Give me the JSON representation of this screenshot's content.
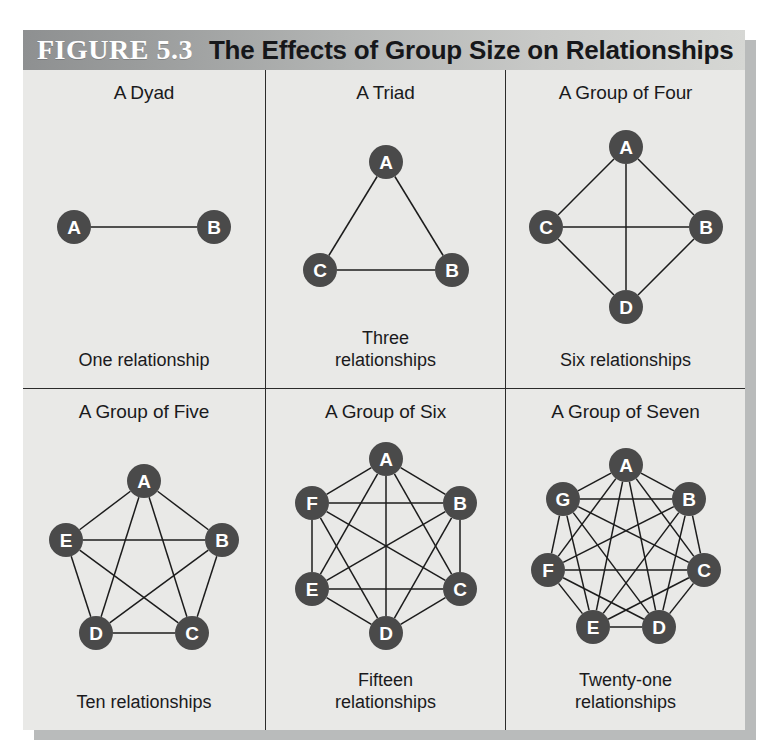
{
  "figure": {
    "label": "FIGURE 5.3",
    "title": "The Effects of Group Size on Relationships",
    "header_bg_left": "#8e9091",
    "header_bg_right": "#d6d7d4",
    "card_bg": "#e9e9e7",
    "node_color": "#4a4a4a",
    "node_text_color": "#ffffff",
    "edge_color": "#1c1c1c"
  },
  "panels": [
    {
      "title": "A Dyad",
      "caption": "One relationship",
      "members": 2,
      "relationships": 1,
      "layout": "linear",
      "nodes": [
        {
          "id": "A",
          "x": 46,
          "y": 72
        },
        {
          "id": "B",
          "x": 186,
          "y": 72
        }
      ],
      "edges": [
        [
          "A",
          "B"
        ]
      ]
    },
    {
      "title": "A Triad",
      "caption": "Three\nrelationships",
      "members": 3,
      "relationships": 3,
      "layout": "polygon",
      "nodes": [
        {
          "id": "A",
          "x": 110,
          "y": 22
        },
        {
          "id": "B",
          "x": 176,
          "y": 130
        },
        {
          "id": "C",
          "x": 44,
          "y": 130
        }
      ],
      "edges": [
        [
          "A",
          "B"
        ],
        [
          "B",
          "C"
        ],
        [
          "C",
          "A"
        ]
      ]
    },
    {
      "title": "A Group of Four",
      "caption": "Six relationships",
      "members": 4,
      "relationships": 6,
      "layout": "diamond",
      "nodes": [
        {
          "id": "A",
          "x": 105,
          "y": 20
        },
        {
          "id": "B",
          "x": 185,
          "y": 100
        },
        {
          "id": "D",
          "x": 105,
          "y": 180
        },
        {
          "id": "C",
          "x": 25,
          "y": 100
        }
      ],
      "edges": [
        [
          "A",
          "B"
        ],
        [
          "A",
          "C"
        ],
        [
          "A",
          "D"
        ],
        [
          "B",
          "C"
        ],
        [
          "B",
          "D"
        ],
        [
          "C",
          "D"
        ]
      ]
    },
    {
      "title": "A Group of Five",
      "caption": "Ten relationships",
      "members": 5,
      "relationships": 10,
      "layout": "pentagon",
      "nodes": [
        {
          "id": "A",
          "x": 104,
          "y": 20
        },
        {
          "id": "B",
          "x": 182,
          "y": 79
        },
        {
          "id": "C",
          "x": 152,
          "y": 172
        },
        {
          "id": "D",
          "x": 56,
          "y": 172
        },
        {
          "id": "E",
          "x": 26,
          "y": 79
        }
      ],
      "edges": [
        [
          "A",
          "B"
        ],
        [
          "A",
          "C"
        ],
        [
          "A",
          "D"
        ],
        [
          "A",
          "E"
        ],
        [
          "B",
          "C"
        ],
        [
          "B",
          "D"
        ],
        [
          "B",
          "E"
        ],
        [
          "C",
          "D"
        ],
        [
          "C",
          "E"
        ],
        [
          "D",
          "E"
        ]
      ]
    },
    {
      "title": "A Group of Six",
      "caption": "Fifteen\nrelationships",
      "members": 6,
      "relationships": 15,
      "layout": "hexagon",
      "nodes": [
        {
          "id": "A",
          "x": 103,
          "y": 18
        },
        {
          "id": "B",
          "x": 177,
          "y": 62
        },
        {
          "id": "C",
          "x": 177,
          "y": 148
        },
        {
          "id": "D",
          "x": 103,
          "y": 192
        },
        {
          "id": "E",
          "x": 29,
          "y": 148
        },
        {
          "id": "F",
          "x": 29,
          "y": 62
        }
      ],
      "edges": [
        [
          "A",
          "B"
        ],
        [
          "A",
          "C"
        ],
        [
          "A",
          "D"
        ],
        [
          "A",
          "E"
        ],
        [
          "A",
          "F"
        ],
        [
          "B",
          "C"
        ],
        [
          "B",
          "D"
        ],
        [
          "B",
          "E"
        ],
        [
          "B",
          "F"
        ],
        [
          "C",
          "D"
        ],
        [
          "C",
          "E"
        ],
        [
          "C",
          "F"
        ],
        [
          "D",
          "E"
        ],
        [
          "D",
          "F"
        ],
        [
          "E",
          "F"
        ]
      ]
    },
    {
      "title": "A Group of Seven",
      "caption": "Twenty-one\nrelationships",
      "members": 7,
      "relationships": 21,
      "layout": "heptagon",
      "nodes": [
        {
          "id": "A",
          "x": 104,
          "y": 18
        },
        {
          "id": "B",
          "x": 167,
          "y": 52
        },
        {
          "id": "C",
          "x": 182,
          "y": 123
        },
        {
          "id": "D",
          "x": 137,
          "y": 180
        },
        {
          "id": "E",
          "x": 71,
          "y": 180
        },
        {
          "id": "F",
          "x": 26,
          "y": 123
        },
        {
          "id": "G",
          "x": 41,
          "y": 52
        }
      ],
      "edges": [
        [
          "A",
          "B"
        ],
        [
          "A",
          "C"
        ],
        [
          "A",
          "D"
        ],
        [
          "A",
          "E"
        ],
        [
          "A",
          "F"
        ],
        [
          "A",
          "G"
        ],
        [
          "B",
          "C"
        ],
        [
          "B",
          "D"
        ],
        [
          "B",
          "E"
        ],
        [
          "B",
          "F"
        ],
        [
          "B",
          "G"
        ],
        [
          "C",
          "D"
        ],
        [
          "C",
          "E"
        ],
        [
          "C",
          "F"
        ],
        [
          "C",
          "G"
        ],
        [
          "D",
          "E"
        ],
        [
          "D",
          "F"
        ],
        [
          "D",
          "G"
        ],
        [
          "E",
          "F"
        ],
        [
          "E",
          "G"
        ],
        [
          "F",
          "G"
        ]
      ]
    }
  ]
}
